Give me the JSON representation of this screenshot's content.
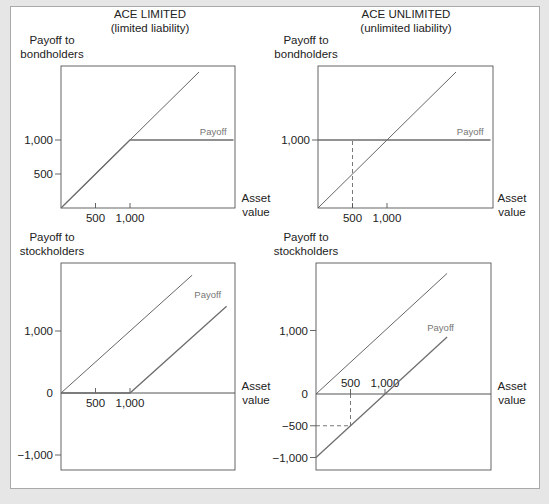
{
  "chart_data": [
    {
      "type": "line",
      "id": "limited-bond",
      "title": "ACE LIMITED",
      "subtitle": "(limited liability)",
      "ylabel": [
        "Payoff to",
        "bondholders"
      ],
      "xlabel": [
        "Asset",
        "value"
      ],
      "xlim": [
        0,
        2500
      ],
      "ylim": [
        0,
        2050
      ],
      "xticks": [
        {
          "v": 500,
          "label": "500"
        },
        {
          "v": 1000,
          "label": "1,000"
        }
      ],
      "yticks": [
        {
          "v": 500,
          "label": "500"
        },
        {
          "v": 1000,
          "label": "1,000"
        }
      ],
      "series": [
        {
          "name": "Asset value (45° line)",
          "points": [
            [
              0,
              0
            ],
            [
              2000,
              2000
            ]
          ],
          "style": "reference"
        },
        {
          "name": "Payoff",
          "points": [
            [
              0,
              0
            ],
            [
              1000,
              1000
            ],
            [
              2500,
              1000
            ]
          ],
          "style": "payoff",
          "label": "Payoff",
          "label_at": [
            2400,
            1080
          ]
        }
      ],
      "guides": []
    },
    {
      "type": "line",
      "id": "unlimited-bond",
      "title": "ACE UNLIMITED",
      "subtitle": "(unlimited liability)",
      "ylabel": [
        "Payoff to",
        "bondholders"
      ],
      "xlabel": [
        "Asset",
        "value"
      ],
      "xlim": [
        0,
        2500
      ],
      "ylim": [
        0,
        2050
      ],
      "xticks": [
        {
          "v": 500,
          "label": "500"
        },
        {
          "v": 1000,
          "label": "1,000"
        }
      ],
      "yticks": [
        {
          "v": 1000,
          "label": "1,000"
        }
      ],
      "series": [
        {
          "name": "Asset value (45° line)",
          "points": [
            [
              0,
              0
            ],
            [
              2000,
              2000
            ]
          ],
          "style": "reference"
        },
        {
          "name": "Payoff",
          "points": [
            [
              0,
              1000
            ],
            [
              2500,
              1000
            ]
          ],
          "style": "payoff",
          "label": "Payoff",
          "label_at": [
            2400,
            1080
          ]
        }
      ],
      "guides": [
        {
          "from": [
            500,
            0
          ],
          "to": [
            500,
            1000
          ]
        }
      ]
    },
    {
      "type": "line",
      "id": "limited-stock",
      "title": "",
      "subtitle": "",
      "ylabel": [
        "Payoff to",
        "stockholders"
      ],
      "xlabel": [
        "Asset",
        "value"
      ],
      "xlim": [
        0,
        2500
      ],
      "ylim": [
        -1100,
        1900
      ],
      "xticks": [
        {
          "v": 500,
          "label": "500"
        },
        {
          "v": 1000,
          "label": "1,000"
        }
      ],
      "yticks": [
        {
          "v": 1000,
          "label": "1,000"
        },
        {
          "v": 0,
          "label": "0"
        },
        {
          "v": -1000,
          "label": "−1,000"
        }
      ],
      "series": [
        {
          "name": "Asset value (45° line)",
          "points": [
            [
              0,
              0
            ],
            [
              1900,
              1900
            ]
          ],
          "style": "reference"
        },
        {
          "name": "Payoff",
          "points": [
            [
              0,
              0
            ],
            [
              1000,
              0
            ],
            [
              2400,
              1400
            ]
          ],
          "style": "payoff",
          "label": "Payoff",
          "label_at": [
            2320,
            1540
          ]
        }
      ],
      "guides": []
    },
    {
      "type": "line",
      "id": "unlimited-stock",
      "title": "",
      "subtitle": "",
      "ylabel": [
        "Payoff to",
        "stockholders"
      ],
      "xlabel": [
        "Asset",
        "value"
      ],
      "xlim": [
        0,
        2500
      ],
      "ylim": [
        -1100,
        1900
      ],
      "xticks": [
        {
          "v": 500,
          "label": "500"
        },
        {
          "v": 1000,
          "label": "1,000"
        }
      ],
      "yticks": [
        {
          "v": 1000,
          "label": "1,000"
        },
        {
          "v": 0,
          "label": "0"
        },
        {
          "v": -500,
          "label": "−500"
        },
        {
          "v": -1000,
          "label": "−1,000"
        }
      ],
      "series": [
        {
          "name": "Asset value (45° line)",
          "points": [
            [
              0,
              0
            ],
            [
              1900,
              1900
            ]
          ],
          "style": "reference"
        },
        {
          "name": "Payoff",
          "points": [
            [
              0,
              -1000
            ],
            [
              1900,
              900
            ]
          ],
          "style": "payoff",
          "label": "Payoff",
          "label_at": [
            2000,
            1000
          ]
        }
      ],
      "guides": [
        {
          "from": [
            500,
            0
          ],
          "to": [
            500,
            -500
          ]
        },
        {
          "from": [
            0,
            -500
          ],
          "to": [
            500,
            -500
          ]
        }
      ]
    }
  ],
  "colors": {
    "reference_line": "#555555",
    "payoff_line": "#6e6e6e",
    "axis": "#555555",
    "payoff_label": "#777777",
    "background": "#e6e6e6",
    "panel": "#ffffff"
  }
}
